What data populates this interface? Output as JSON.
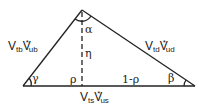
{
  "diagram": {
    "title": "",
    "vertices": {
      "apex": [
        82,
        10
      ],
      "left": [
        23,
        86
      ],
      "right": [
        195,
        86
      ]
    },
    "sides": {
      "left": {
        "V": "V",
        "sub1": "tb",
        "V2": "V",
        "sub2": "ub",
        "star": "*"
      },
      "right": {
        "V": "V",
        "sub1": "td",
        "V2": "V",
        "sub2": "ud",
        "star": "*"
      },
      "base": {
        "V": "V",
        "sub1": "ts",
        "V2": "V",
        "sub2": "us",
        "star": "*"
      }
    },
    "angles": {
      "apex": "α",
      "left": "γ",
      "right": "β"
    },
    "height_label": "η",
    "base_segments": {
      "left": "ρ",
      "right": "1-ρ"
    }
  }
}
